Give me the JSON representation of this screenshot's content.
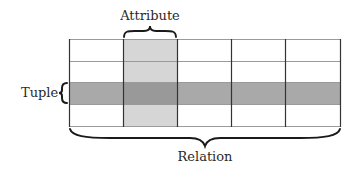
{
  "diagram": {
    "labels": {
      "attribute": "Attribute",
      "tuple": "Tuple",
      "relation": "Relation"
    },
    "grid": {
      "columns": 5,
      "rows": 4,
      "highlighted_column_index": 1,
      "highlighted_row_index": 2
    },
    "colors": {
      "grid_line": "#333333",
      "inner_line": "#9a9a9a",
      "attribute_fill": "#d6d6d6",
      "tuple_fill": "#a9a9a9",
      "intersection_fill": "#999999",
      "brace": "#1a1a1a",
      "text": "#2a2a2a"
    }
  }
}
